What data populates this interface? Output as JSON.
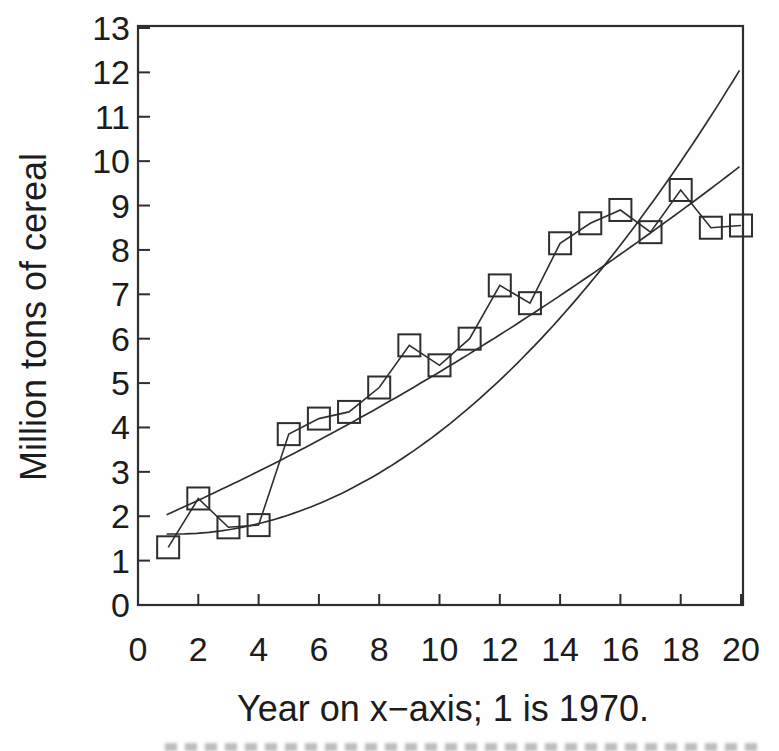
{
  "chart_data": {
    "type": "line",
    "title": "",
    "xlabel": "Year on x−axis; 1 is 1970.",
    "ylabel": "Million tons of cereal",
    "xlim": [
      0,
      20.1
    ],
    "ylim": [
      0,
      13
    ],
    "x_ticks": [
      0,
      2,
      4,
      6,
      8,
      10,
      12,
      14,
      16,
      18,
      20
    ],
    "y_ticks": [
      0,
      1,
      2,
      3,
      4,
      5,
      6,
      7,
      8,
      9,
      10,
      11,
      12,
      13
    ],
    "grid": false,
    "legend": "none",
    "ink_color": "#2e2e2e",
    "background_color": "#fefefe",
    "series": [
      {
        "name": "cereal-production-observed",
        "marker": "open-square",
        "line_style": "solid",
        "x": [
          1,
          2,
          3,
          4,
          5,
          6,
          7,
          8,
          9,
          10,
          11,
          12,
          13,
          14,
          15,
          16,
          17,
          18,
          19,
          20
        ],
        "y": [
          1.3,
          2.4,
          1.75,
          1.8,
          3.85,
          4.2,
          4.35,
          4.9,
          5.85,
          5.4,
          6.0,
          7.2,
          6.8,
          8.15,
          8.6,
          8.9,
          8.4,
          9.35,
          8.5,
          8.55
        ]
      }
    ],
    "curves": [
      {
        "name": "fitted-curve-gentle",
        "model": "quadratic",
        "coefficients": {
          "intercept": 1.752,
          "linear": 0.2922,
          "quadratic": 0.00576
        },
        "domain": [
          0.95,
          20.1
        ],
        "start_point": [
          1,
          2.05
        ],
        "end_point": [
          20,
          9.9
        ]
      },
      {
        "name": "fitted-curve-steep",
        "model": "quadratic",
        "coefficients": {
          "intercept": 1.641,
          "linear": -0.071,
          "quadratic": 0.0297
        },
        "domain": [
          0.95,
          20.1
        ],
        "start_point": [
          1,
          1.6
        ],
        "end_point": [
          20,
          12.2
        ]
      }
    ]
  }
}
